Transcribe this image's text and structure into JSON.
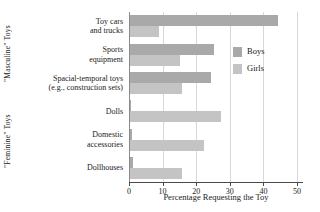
{
  "chart_data": {
    "type": "bar",
    "orientation": "horizontal",
    "title": "",
    "xlabel": "Percentage Requesting the Toy",
    "ylabel": "",
    "xlim": [
      0,
      50
    ],
    "xticks": [
      0,
      10,
      20,
      30,
      40,
      50
    ],
    "grid": "vertical",
    "legend_position": "upper-right-inside",
    "categories": [
      "Toy cars and trucks",
      "Sports equipment",
      "Spacial-temporal toys (e.g., construction sets)",
      "Dolls",
      "Domestic accessories",
      "Dollhouses"
    ],
    "category_lines": [
      [
        "Toy cars",
        "and trucks"
      ],
      [
        "Sports",
        "equipment"
      ],
      [
        "Spacial-temporal toys",
        "(e.g., construction sets)"
      ],
      [
        "Dolls"
      ],
      [
        "Domestic",
        "accessories"
      ],
      [
        "Dollhouses"
      ]
    ],
    "series": [
      {
        "name": "Boys",
        "color": "#a9a9a9",
        "values": [
          44,
          25,
          24,
          0.3,
          0.5,
          1
        ]
      },
      {
        "name": "Girls",
        "color": "#c4c4c4",
        "values": [
          8.5,
          15,
          15.5,
          27,
          22,
          15.5
        ]
      }
    ],
    "group_labels": [
      {
        "text": "\"Masculine\" Toys",
        "categories": [
          "Toy cars and trucks",
          "Sports equipment",
          "Spacial-temporal toys (e.g., construction sets)"
        ]
      },
      {
        "text": "\"Feminine\" Toys",
        "categories": [
          "Dolls",
          "Domestic accessories",
          "Dollhouses"
        ]
      }
    ]
  },
  "legend": {
    "items": [
      {
        "label": "Boys"
      },
      {
        "label": "Girls"
      }
    ]
  },
  "axis": {
    "x_tick_labels": [
      "0",
      "10",
      "20",
      "30",
      "40",
      "50"
    ],
    "x_title": "Percentage Requesting the Toy"
  },
  "colors": {
    "boys": "#a9a9a9",
    "girls": "#c4c4c4",
    "grid": "#d8d8d8",
    "axis": "#4a4a4a",
    "text": "#1a1a1a",
    "background": "#ffffff"
  }
}
